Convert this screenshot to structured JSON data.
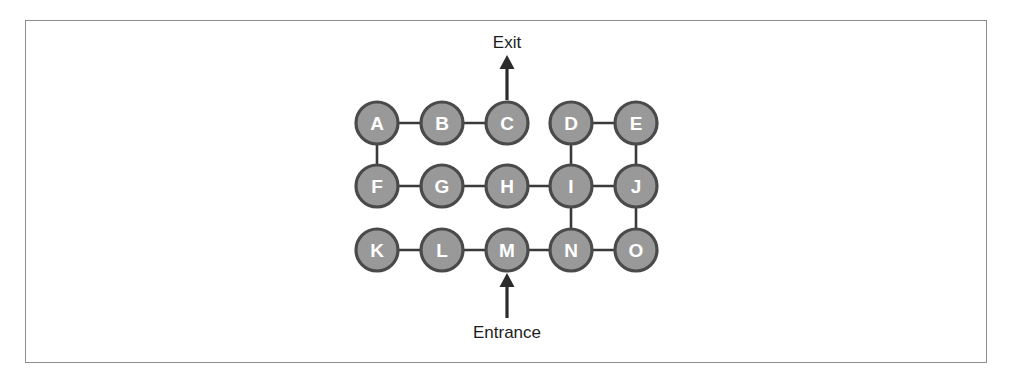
{
  "figure": {
    "background_color": "#ffffff",
    "frame_color": "#8d8d8d"
  },
  "style": {
    "node_fill": "#999999",
    "node_stroke": "#4a4a4a",
    "node_label_color": "#ffffff",
    "edge_color": "#3a3a3a",
    "arrow_color": "#2b2b2b",
    "annotation_color": "#1d1d1d",
    "node_radius": 21
  },
  "chart_data": {
    "type": "diagram",
    "subtype": "undirected-graph",
    "layout": "grid",
    "grid": {
      "rows": 3,
      "cols": 5,
      "col_spacing": 64.5,
      "row_spacing": 63.5
    },
    "nodes": [
      {
        "id": "A",
        "label": "A",
        "row": 0,
        "col": 0,
        "x": 377,
        "y": 123
      },
      {
        "id": "B",
        "label": "B",
        "row": 0,
        "col": 1,
        "x": 442,
        "y": 123
      },
      {
        "id": "C",
        "label": "C",
        "row": 0,
        "col": 2,
        "x": 507,
        "y": 123
      },
      {
        "id": "D",
        "label": "D",
        "row": 0,
        "col": 3,
        "x": 571,
        "y": 123
      },
      {
        "id": "E",
        "label": "E",
        "row": 0,
        "col": 4,
        "x": 636,
        "y": 123
      },
      {
        "id": "F",
        "label": "F",
        "row": 1,
        "col": 0,
        "x": 377,
        "y": 186
      },
      {
        "id": "G",
        "label": "G",
        "row": 1,
        "col": 1,
        "x": 442,
        "y": 186
      },
      {
        "id": "H",
        "label": "H",
        "row": 1,
        "col": 2,
        "x": 507,
        "y": 186
      },
      {
        "id": "I",
        "label": "I",
        "row": 1,
        "col": 3,
        "x": 571,
        "y": 186
      },
      {
        "id": "J",
        "label": "J",
        "row": 1,
        "col": 4,
        "x": 636,
        "y": 186
      },
      {
        "id": "K",
        "label": "K",
        "row": 2,
        "col": 0,
        "x": 377,
        "y": 250
      },
      {
        "id": "L",
        "label": "L",
        "row": 2,
        "col": 1,
        "x": 442,
        "y": 250
      },
      {
        "id": "M",
        "label": "M",
        "row": 2,
        "col": 2,
        "x": 507,
        "y": 250
      },
      {
        "id": "N",
        "label": "N",
        "row": 2,
        "col": 3,
        "x": 571,
        "y": 250
      },
      {
        "id": "O",
        "label": "O",
        "row": 2,
        "col": 4,
        "x": 636,
        "y": 250
      }
    ],
    "edges": [
      {
        "from": "A",
        "to": "B",
        "orientation": "horizontal"
      },
      {
        "from": "B",
        "to": "C",
        "orientation": "horizontal"
      },
      {
        "from": "D",
        "to": "E",
        "orientation": "horizontal"
      },
      {
        "from": "F",
        "to": "G",
        "orientation": "horizontal"
      },
      {
        "from": "G",
        "to": "H",
        "orientation": "horizontal"
      },
      {
        "from": "H",
        "to": "I",
        "orientation": "horizontal"
      },
      {
        "from": "I",
        "to": "J",
        "orientation": "horizontal"
      },
      {
        "from": "K",
        "to": "L",
        "orientation": "horizontal"
      },
      {
        "from": "L",
        "to": "M",
        "orientation": "horizontal"
      },
      {
        "from": "M",
        "to": "N",
        "orientation": "horizontal"
      },
      {
        "from": "N",
        "to": "O",
        "orientation": "horizontal"
      },
      {
        "from": "A",
        "to": "F",
        "orientation": "vertical"
      },
      {
        "from": "D",
        "to": "I",
        "orientation": "vertical"
      },
      {
        "from": "E",
        "to": "J",
        "orientation": "vertical"
      },
      {
        "from": "I",
        "to": "N",
        "orientation": "vertical"
      },
      {
        "from": "J",
        "to": "O",
        "orientation": "vertical"
      }
    ],
    "annotations": [
      {
        "id": "exit",
        "label": "Exit",
        "attached_node": "C",
        "direction": "up",
        "label_x": 507,
        "label_y": 48,
        "arrow_from_x": 507,
        "arrow_from_y": 100,
        "arrow_to_x": 507,
        "arrow_to_y": 55
      },
      {
        "id": "entrance",
        "label": "Entrance",
        "attached_node": "M",
        "direction": "up",
        "label_x": 507,
        "label_y": 338,
        "arrow_from_x": 507,
        "arrow_from_y": 318,
        "arrow_to_x": 507,
        "arrow_to_y": 273
      }
    ]
  }
}
